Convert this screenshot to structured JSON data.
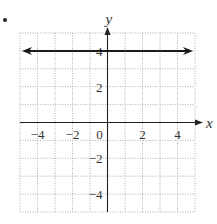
{
  "problem_marker": "•",
  "chart_data": {
    "type": "line",
    "title": "",
    "xlabel": "x",
    "ylabel": "y",
    "xlim": [
      -5,
      5
    ],
    "ylim": [
      -5,
      5
    ],
    "grid": true,
    "grid_style": "dotted",
    "x_ticks": [
      -4,
      -2,
      0,
      2,
      4
    ],
    "y_ticks": [
      4,
      2,
      -2,
      -4
    ],
    "x_tick_labels": [
      "−4",
      "−2",
      "0",
      "2",
      "4"
    ],
    "y_tick_labels": [
      "4",
      "2",
      "−2",
      "−4"
    ],
    "series": [
      {
        "name": "y = 4",
        "equation": "y = 4",
        "x": [
          -5,
          5
        ],
        "y": [
          4,
          4
        ],
        "arrows": "both",
        "color": "#1a1a1a"
      }
    ],
    "legend": null
  },
  "colors": {
    "grid": "#9a9a9a",
    "axis": "#222222",
    "line": "#1a1a1a",
    "text": "#333333"
  }
}
